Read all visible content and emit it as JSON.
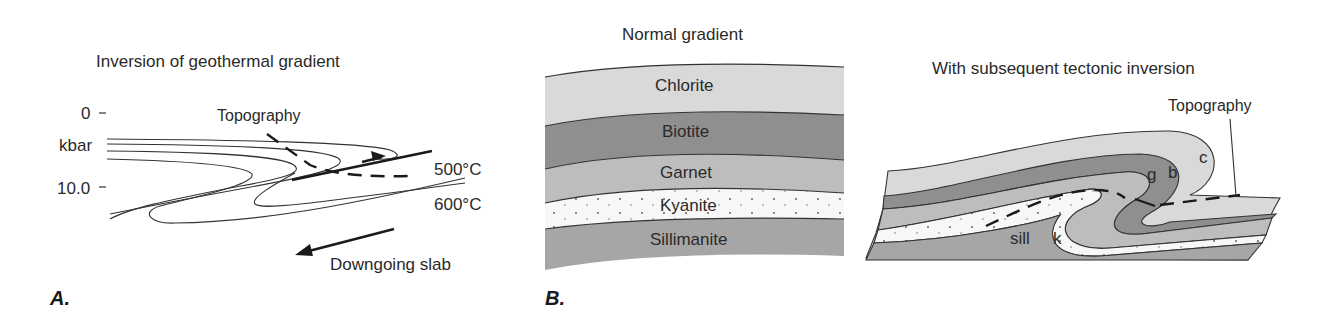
{
  "figure": {
    "panel_a": {
      "label": "A.",
      "title": "Inversion of geothermal gradient",
      "axis": {
        "tick_top": "0",
        "tick_bottom": "10.0",
        "unit": "kbar"
      },
      "isotherms": [
        "500°C",
        "600°C"
      ],
      "topography_label": "Topography",
      "slab_label": "Downgoing slab"
    },
    "panel_b": {
      "label": "B.",
      "normal": {
        "title": "Normal gradient",
        "zones": [
          "Chlorite",
          "Biotite",
          "Garnet",
          "Kyanite",
          "Sillimanite"
        ]
      },
      "inverted": {
        "title": "With subsequent tectonic inversion",
        "topography_label": "Topography",
        "zone_abbrev": [
          "c",
          "b",
          "g",
          "k",
          "sill"
        ]
      }
    },
    "colors": {
      "chlorite": "#d9d9d9",
      "biotite": "#8f8f8f",
      "garnet": "#bdbdbd",
      "kyanite": "#f7f7f7",
      "sillimanite": "#a6a6a6",
      "line": "#333333"
    }
  }
}
